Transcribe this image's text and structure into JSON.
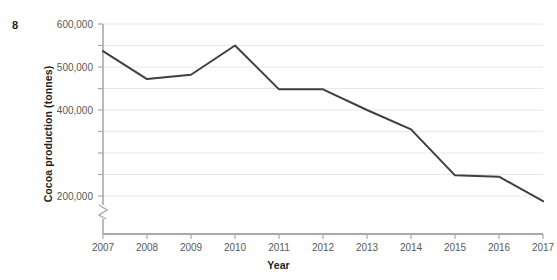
{
  "figure": {
    "number": "8"
  },
  "axis_titles": {
    "x": "Year",
    "y": "Cocoa production (tonnes)"
  },
  "colors": {
    "line": "#3f3f3f",
    "gridline": "#e8e8e8",
    "axis": "#a7a9ac",
    "tick_text": "#58595b",
    "title_text": "#231f20",
    "background": "#ffffff"
  },
  "chart_data": {
    "type": "line",
    "title": "",
    "subtitle": "",
    "xlabel": "Year",
    "ylabel": "Cocoa production (tonnes)",
    "categories": [
      "2007",
      "2008",
      "2009",
      "2010",
      "2011",
      "2012",
      "2013",
      "2014",
      "2015",
      "2016",
      "2017"
    ],
    "x": [
      2007,
      2008,
      2009,
      2010,
      2011,
      2012,
      2013,
      2014,
      2015,
      2016,
      2017
    ],
    "values": [
      537000,
      472000,
      482000,
      550000,
      448000,
      448000,
      400000,
      355000,
      248000,
      245000,
      188000
    ],
    "series": [
      {
        "name": "Cocoa production",
        "values": [
          537000,
          472000,
          482000,
          550000,
          448000,
          448000,
          400000,
          355000,
          248000,
          245000,
          188000
        ]
      }
    ],
    "ylim": [
      180000,
      600000
    ],
    "xlim": [
      2007,
      2017
    ],
    "y_gridline_values": [
      200000,
      250000,
      300000,
      350000,
      400000,
      450000,
      500000,
      550000,
      600000
    ],
    "y_tick_labels": [
      {
        "value": 600000,
        "label": "600,000"
      },
      {
        "value": 500000,
        "label": "500,000"
      },
      {
        "value": 400000,
        "label": "400,000"
      },
      {
        "value": 200000,
        "label": "200,000"
      }
    ],
    "x_tick_labels": [
      "2007",
      "2008",
      "2009",
      "2010",
      "2011",
      "2012",
      "2013",
      "2014",
      "2015",
      "2016",
      "2017"
    ],
    "grid": true,
    "grid_axis": "y",
    "legend": false,
    "legend_position": "none",
    "axis_break": {
      "axis": "y",
      "present": true,
      "description": "zigzag break mark on y-axis below 200,000"
    },
    "markers": false,
    "annotations": []
  }
}
